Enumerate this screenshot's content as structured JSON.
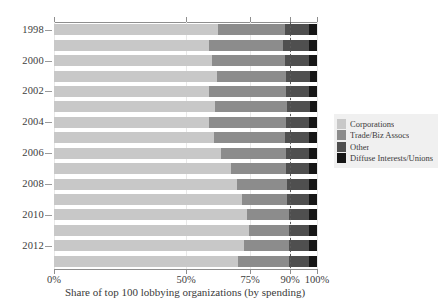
{
  "chart_data": {
    "type": "bar",
    "orientation": "horizontal",
    "stacked": true,
    "normalized_percent": true,
    "title": "",
    "xlabel": "Share of top 100 lobbying organizations (by spending)",
    "ylabel": "",
    "xlim": [
      0,
      100
    ],
    "xticks": [
      0,
      50,
      75,
      90,
      100
    ],
    "xticklabels": [
      "0%",
      "50%",
      "75%",
      "90%",
      "100%"
    ],
    "x_scale_note": "non-linear axis: 0-50 compressed, 50-100 expanded",
    "grid": true,
    "legend_position": "right",
    "reference_line": {
      "value": 90,
      "style": "dashed",
      "label": "90%"
    },
    "categories": [
      "1998",
      "1999",
      "2000",
      "2001",
      "2002",
      "2003",
      "2004",
      "2005",
      "2006",
      "2007",
      "2008",
      "2009",
      "2010",
      "2011",
      "2012",
      "2013"
    ],
    "ytick_labels": [
      "1998",
      "2000",
      "2002",
      "2004",
      "2006",
      "2008",
      "2010",
      "2012"
    ],
    "series": [
      {
        "name": "Corporations",
        "color": "#c8c8c8",
        "values": [
          62.5,
          59.0,
          60.0,
          62.0,
          59.0,
          61.5,
          59.0,
          61.0,
          63.5,
          67.5,
          70.0,
          72.0,
          74.0,
          74.5,
          72.5,
          70.5
        ]
      },
      {
        "name": "Trade/Biz Assocs",
        "color": "#8c8c8c",
        "values": [
          25.5,
          28.5,
          28.0,
          26.5,
          29.5,
          27.5,
          29.5,
          27.0,
          25.0,
          21.0,
          19.0,
          17.0,
          15.5,
          15.0,
          17.0,
          19.0
        ]
      },
      {
        "name": "Other",
        "color": "#4f4f4f",
        "values": [
          9.0,
          9.5,
          9.0,
          9.0,
          8.5,
          8.5,
          8.5,
          9.0,
          8.5,
          8.5,
          8.0,
          8.0,
          7.5,
          7.5,
          7.5,
          7.5
        ]
      },
      {
        "name": "Diffuse Interests/Unions",
        "color": "#161616",
        "values": [
          3.0,
          3.0,
          3.0,
          2.5,
          3.0,
          2.5,
          3.0,
          3.0,
          3.0,
          3.0,
          3.0,
          3.0,
          3.0,
          3.0,
          3.0,
          3.0
        ]
      }
    ],
    "legend": [
      {
        "label": "Corporations",
        "color": "#c8c8c8"
      },
      {
        "label": "Trade/Biz Assocs",
        "color": "#8c8c8c"
      },
      {
        "label": "Other",
        "color": "#4f4f4f"
      },
      {
        "label": "Diffuse Interests/Unions",
        "color": "#161616"
      }
    ]
  }
}
